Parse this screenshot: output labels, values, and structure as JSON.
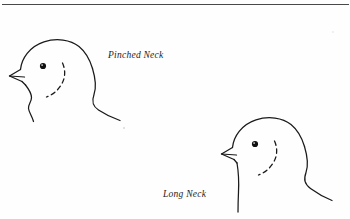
{
  "page": {
    "width": 350,
    "height": 219,
    "background_color": "#fefefe",
    "ink_color": "#1a1a1a"
  },
  "rule": {
    "name": "top-horizontal-rule",
    "color": "#3a3a3a"
  },
  "figures": [
    {
      "id": "pinched-neck",
      "label": "Pinched Neck",
      "subject": "bird-head-profile",
      "eye": {
        "cx": 43,
        "cy": 66,
        "r": 3.1,
        "color": "#111111"
      },
      "beak": "wedge",
      "cheek_marking": "dotted-crescent",
      "neck_form": "pinched"
    },
    {
      "id": "long-neck",
      "label": "Long Neck",
      "subject": "bird-head-profile",
      "eye": {
        "cx": 255,
        "cy": 144,
        "r": 3.1,
        "color": "#111111"
      },
      "beak": "wedge",
      "cheek_marking": "dotted-crescent",
      "neck_form": "long"
    }
  ]
}
